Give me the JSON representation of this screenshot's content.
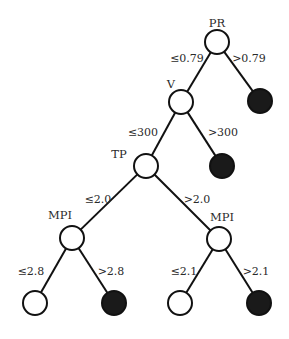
{
  "diagram": {
    "type": "decision-tree",
    "colors": {
      "stroke": "#111111",
      "internal_fill": "#ffffff",
      "positive_leaf_fill": "#1a1a1a",
      "negative_leaf_fill": "#ffffff",
      "text": "#2a2a2a"
    },
    "nodes": [
      {
        "id": "pr",
        "kind": "split",
        "label": "PR",
        "cx": 217,
        "cy": 42,
        "lx": 217,
        "ly": 27
      },
      {
        "id": "pr_r",
        "kind": "leaf-positive",
        "label": "",
        "cx": 260,
        "cy": 101
      },
      {
        "id": "v",
        "kind": "split",
        "label": "V",
        "cx": 181,
        "cy": 102,
        "lx": 171,
        "ly": 88
      },
      {
        "id": "v_r",
        "kind": "leaf-positive",
        "label": "",
        "cx": 222,
        "cy": 166
      },
      {
        "id": "tp",
        "kind": "split",
        "label": "TP",
        "cx": 146,
        "cy": 166,
        "lx": 119,
        "ly": 158
      },
      {
        "id": "mpi_l",
        "kind": "split",
        "label": "MPI",
        "cx": 72,
        "cy": 238,
        "lx": 60,
        "ly": 219
      },
      {
        "id": "mpi_r",
        "kind": "split",
        "label": "MPI",
        "cx": 219,
        "cy": 239,
        "lx": 222,
        "ly": 221
      },
      {
        "id": "ll",
        "kind": "leaf-negative",
        "label": "",
        "cx": 35,
        "cy": 303
      },
      {
        "id": "lr",
        "kind": "leaf-positive",
        "label": "",
        "cx": 114,
        "cy": 303
      },
      {
        "id": "rl",
        "kind": "leaf-negative",
        "label": "",
        "cx": 180,
        "cy": 303
      },
      {
        "id": "rr",
        "kind": "leaf-positive",
        "label": "",
        "cx": 259,
        "cy": 303
      }
    ],
    "edges": [
      {
        "from": "pr",
        "to": "v",
        "label": "≤0.79",
        "lx": 187,
        "ly": 62
      },
      {
        "from": "pr",
        "to": "pr_r",
        "label": ">0.79",
        "lx": 249,
        "ly": 62
      },
      {
        "from": "v",
        "to": "tp",
        "label": "≤300",
        "lx": 143,
        "ly": 136
      },
      {
        "from": "v",
        "to": "v_r",
        "label": ">300",
        "lx": 223,
        "ly": 136
      },
      {
        "from": "tp",
        "to": "mpi_l",
        "label": "≤2.0",
        "lx": 98,
        "ly": 203
      },
      {
        "from": "tp",
        "to": "mpi_r",
        "label": ">2.0",
        "lx": 197,
        "ly": 203
      },
      {
        "from": "mpi_l",
        "to": "ll",
        "label": "≤2.8",
        "lx": 31,
        "ly": 275
      },
      {
        "from": "mpi_l",
        "to": "lr",
        "label": ">2.8",
        "lx": 111,
        "ly": 275
      },
      {
        "from": "mpi_r",
        "to": "rl",
        "label": "≤2.1",
        "lx": 184,
        "ly": 275
      },
      {
        "from": "mpi_r",
        "to": "rr",
        "label": ">2.1",
        "lx": 256,
        "ly": 275
      }
    ],
    "node_radius": 12
  }
}
